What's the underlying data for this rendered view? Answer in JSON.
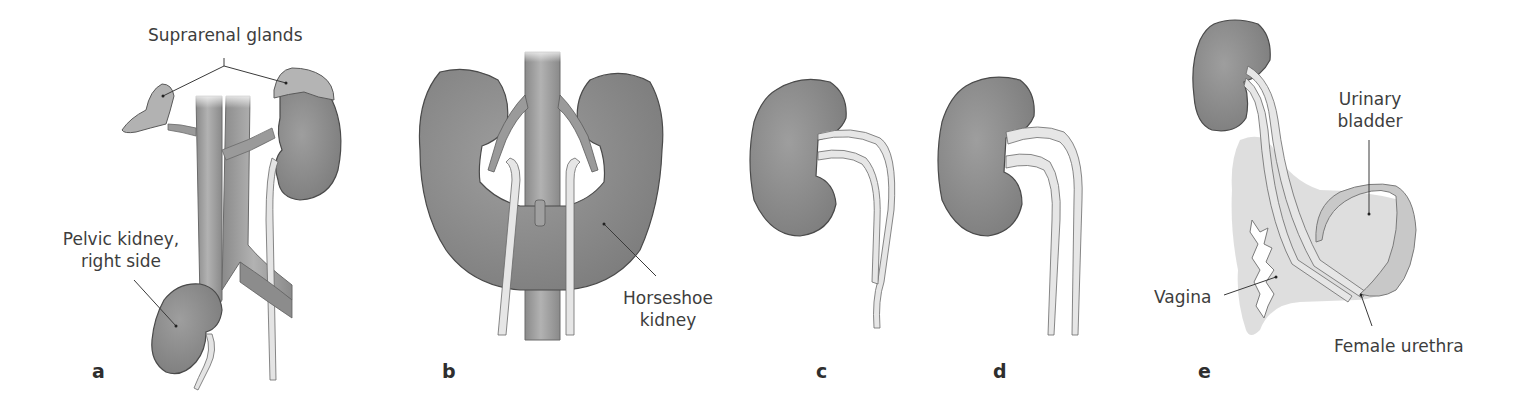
{
  "figure": {
    "panels": [
      {
        "letter": "a",
        "labels": {
          "suprarenal": "Suprarenal glands",
          "pelvic_line1": "Pelvic kidney,",
          "pelvic_line2": "right side"
        }
      },
      {
        "letter": "b",
        "labels": {
          "horseshoe_line1": "Horseshoe",
          "horseshoe_line2": "kidney"
        }
      },
      {
        "letter": "c",
        "labels": {}
      },
      {
        "letter": "d",
        "labels": {}
      },
      {
        "letter": "e",
        "labels": {
          "bladder_line1": "Urinary",
          "bladder_line2": "bladder",
          "vagina": "Vagina",
          "urethra": "Female urethra"
        }
      }
    ],
    "colors": {
      "organ_fill": "#8f8f8f",
      "organ_stroke": "#4a4a4a",
      "vessel_fill": "#a3a3a3",
      "ureter_fill": "#e6e6e6",
      "gland_fill": "#b4b4b4",
      "pelvis_fill": "#d2d2d2",
      "leader_line": "#3a3a3a"
    }
  }
}
